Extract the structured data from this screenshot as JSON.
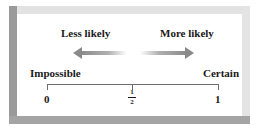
{
  "diagram": {
    "type": "probability-scale",
    "direction_labels": {
      "left": "Less likely",
      "right": "More likely"
    },
    "endpoint_labels": {
      "left": "Impossible",
      "right": "Certain"
    },
    "ticks": [
      {
        "label": "0",
        "position": 0
      },
      {
        "label_numerator": "1",
        "label_denominator": "2",
        "position": 0.5
      },
      {
        "label": "1",
        "position": 1
      }
    ],
    "colors": {
      "arrow": "#8a8a8a",
      "axis": "#6e6e6e",
      "text": "#1a1a1a",
      "frame_light": "#e2e2e2",
      "frame_dark": "#9a9a9a"
    }
  }
}
